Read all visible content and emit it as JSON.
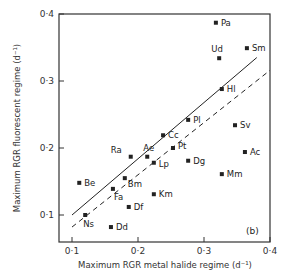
{
  "chart_data": {
    "type": "scatter",
    "title": "",
    "panel_label": "(b)",
    "xlabel": "Maximum RGR metal halide regime (d⁻¹)",
    "ylabel": "Maximum RGR fluorescent regime (d⁻¹)",
    "xlim": [
      0.08,
      0.4
    ],
    "ylim": [
      0.06,
      0.4
    ],
    "xticks": [
      0.1,
      0.2,
      0.3,
      0.4
    ],
    "xtick_labels": [
      "0·1",
      "0·2",
      "0·3",
      "0·4"
    ],
    "yticks": [
      0.1,
      0.2,
      0.3,
      0.4
    ],
    "ytick_labels": [
      "0·1",
      "0·2",
      "0·3",
      "0·4"
    ],
    "grid": false,
    "legend": null,
    "points": [
      {
        "label": "Pa",
        "x": 0.318,
        "y": 0.387
      },
      {
        "label": "Ud",
        "x": 0.323,
        "y": 0.334
      },
      {
        "label": "Sm",
        "x": 0.365,
        "y": 0.349
      },
      {
        "label": "Hl",
        "x": 0.327,
        "y": 0.288
      },
      {
        "label": "Pl",
        "x": 0.276,
        "y": 0.242
      },
      {
        "label": "Sv",
        "x": 0.347,
        "y": 0.234
      },
      {
        "label": "Cc",
        "x": 0.238,
        "y": 0.219
      },
      {
        "label": "Ra",
        "x": 0.189,
        "y": 0.187
      },
      {
        "label": "Ae",
        "x": 0.214,
        "y": 0.187
      },
      {
        "label": "Pt",
        "x": 0.253,
        "y": 0.2
      },
      {
        "label": "Lp",
        "x": 0.224,
        "y": 0.178
      },
      {
        "label": "Dg",
        "x": 0.276,
        "y": 0.181
      },
      {
        "label": "Ac",
        "x": 0.362,
        "y": 0.194
      },
      {
        "label": "Mm",
        "x": 0.327,
        "y": 0.161
      },
      {
        "label": "Km",
        "x": 0.224,
        "y": 0.131
      },
      {
        "label": "Be",
        "x": 0.111,
        "y": 0.148
      },
      {
        "label": "Bm",
        "x": 0.18,
        "y": 0.155
      },
      {
        "label": "Fa",
        "x": 0.162,
        "y": 0.139
      },
      {
        "label": "Df",
        "x": 0.186,
        "y": 0.112
      },
      {
        "label": "Ns",
        "x": 0.12,
        "y": 0.1
      },
      {
        "label": "Dd",
        "x": 0.159,
        "y": 0.082
      }
    ],
    "lines": [
      {
        "name": "solid",
        "style": "solid",
        "x": [
          0.1,
          0.38
        ],
        "y": [
          0.1,
          0.335
        ]
      },
      {
        "name": "dashed",
        "style": "dashed",
        "x": [
          0.1,
          0.4
        ],
        "y": [
          0.082,
          0.316
        ]
      }
    ]
  },
  "label_offsets": {
    "Pa": [
      5,
      3
    ],
    "Ud": [
      -8,
      -6
    ],
    "Sm": [
      5,
      3
    ],
    "Hl": [
      5,
      3
    ],
    "Pl": [
      5,
      3
    ],
    "Sv": [
      5,
      3
    ],
    "Cc": [
      5,
      3
    ],
    "Ra": [
      -20,
      -4
    ],
    "Ae": [
      -4,
      -6
    ],
    "Pt": [
      5,
      1
    ],
    "Lp": [
      5,
      4
    ],
    "Dg": [
      5,
      3
    ],
    "Ac": [
      5,
      3
    ],
    "Mm": [
      5,
      3
    ],
    "Km": [
      5,
      3
    ],
    "Be": [
      5,
      3
    ],
    "Bm": [
      3,
      9
    ],
    "Fa": [
      1,
      11
    ],
    "Df": [
      5,
      3
    ],
    "Ns": [
      -2,
      12
    ],
    "Dd": [
      5,
      3
    ]
  },
  "colors": {
    "ink": "#222222",
    "axis": "#333333",
    "background": "#ffffff"
  }
}
